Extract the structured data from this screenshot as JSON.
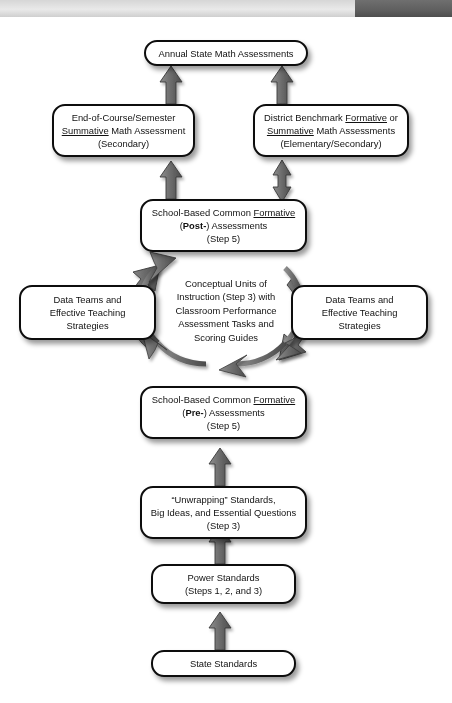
{
  "header": {
    "light_segment": "",
    "dark_segment": ""
  },
  "diagram": {
    "title": "",
    "nodes": [
      {
        "id": "annual-state-math-assessments",
        "lines": [
          "Annual State Math Assessments"
        ],
        "text": "Annual State Math Assessments"
      },
      {
        "id": "end-of-course-semester-summative",
        "lines": [
          "End-of-Course/Semester",
          "Summative Math Assessment",
          "(Secondary)"
        ],
        "text": "End-of-Course/Semester Summative Math Assessment (Secondary)"
      },
      {
        "id": "district-benchmark",
        "lines": [
          "District Benchmark Formative or",
          "Summative Math Assessments",
          "(Elementary/Secondary)"
        ],
        "text": "District Benchmark Formative or Summative Math Assessments (Elementary/Secondary)"
      },
      {
        "id": "school-based-common-formative-post",
        "lines": [
          "School-Based Common Formative",
          "(Post-) Assessments",
          "(Step 5)"
        ],
        "text": "School-Based Common Formative (Post-) Assessments (Step 5)"
      },
      {
        "id": "data-teams-left",
        "lines": [
          "Data Teams and",
          "Effective Teaching",
          "Strategies"
        ],
        "text": "Data Teams and Effective Teaching Strategies"
      },
      {
        "id": "data-teams-right",
        "lines": [
          "Data Teams and",
          "Effective Teaching",
          "Strategies"
        ],
        "text": "Data Teams and Effective Teaching Strategies"
      },
      {
        "id": "school-based-common-formative-pre",
        "lines": [
          "School-Based Common Formative",
          "(Pre-) Assessments",
          "(Step 5)"
        ],
        "text": "School-Based Common Formative (Pre-) Assessments (Step 5)"
      },
      {
        "id": "unwrapping-standards",
        "lines": [
          "“Unwrapping” Standards,",
          "Big Ideas, and Essential Questions",
          "(Step 3)"
        ],
        "text": "“Unwrapping” Standards, Big Ideas, and Essential Questions (Step 3)"
      },
      {
        "id": "power-standards",
        "lines": [
          "Power Standards",
          "(Steps 1, 2, and 3)"
        ],
        "text": "Power Standards (Steps 1, 2, and 3)"
      },
      {
        "id": "state-standards",
        "lines": [
          "State Standards"
        ],
        "text": "State Standards"
      }
    ],
    "cycle_center": {
      "id": "conceptual-units-of-instruction",
      "lines": [
        "Conceptual Units of",
        "Instruction (Step 3) with",
        "Classroom Performance",
        "Assessment Tasks and",
        "Scoring Guides"
      ],
      "text": "Conceptual Units of Instruction (Step 3) with Classroom Performance Assessment Tasks and Scoring Guides"
    },
    "connectors": [
      {
        "id": "post-to-eoc",
        "kind": "single-up"
      },
      {
        "id": "post-to-district",
        "kind": "double-vertical"
      },
      {
        "id": "eoc-to-annual",
        "kind": "single-up"
      },
      {
        "id": "district-to-annual",
        "kind": "single-up"
      },
      {
        "id": "cycle-top-left",
        "kind": "curved-ccw"
      },
      {
        "id": "cycle-top-right",
        "kind": "curved-cw"
      },
      {
        "id": "cycle-bottom-right",
        "kind": "curved-cw"
      },
      {
        "id": "cycle-bottom-left",
        "kind": "curved-ccw"
      },
      {
        "id": "pre-to-cycle",
        "kind": "single-up"
      },
      {
        "id": "unwrapping-to-pre",
        "kind": "single-up"
      },
      {
        "id": "power-to-unwrapping",
        "kind": "single-up"
      },
      {
        "id": "state-to-power",
        "kind": "single-up"
      }
    ],
    "colors": {
      "node_border": "#0d0d0d",
      "node_fill": "#ffffff",
      "arrow": "#6b6b6b",
      "arrow_outline": "#2b2b2b",
      "text": "#111111",
      "header_light": "#e0e0e0",
      "header_dark": "#5e5e5e"
    }
  }
}
